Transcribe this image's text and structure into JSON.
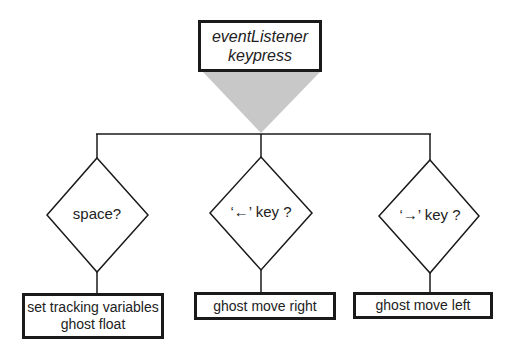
{
  "diagram": {
    "type": "flowchart",
    "root": {
      "lines": [
        "eventListener",
        "keypress"
      ],
      "style": "italic"
    },
    "connector_color": "#c8c8c8",
    "decisions": [
      {
        "label": "space?",
        "action": {
          "lines": [
            "set tracking variables",
            "ghost float"
          ]
        }
      },
      {
        "label": "‘←’ key ?",
        "action": {
          "lines": [
            "ghost move right"
          ]
        }
      },
      {
        "label": "‘→’ key ?",
        "action": {
          "lines": [
            "ghost move left"
          ]
        }
      }
    ]
  }
}
